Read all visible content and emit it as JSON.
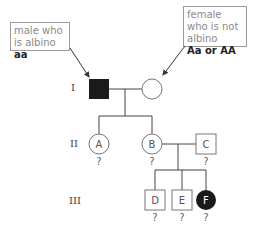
{
  "callouts": {
    "male": {
      "text": "male who is albino",
      "genotype": "aa"
    },
    "female": {
      "text": "female who is not albino",
      "genotype": "Aa or AA"
    }
  },
  "generations": [
    "I",
    "II",
    "III"
  ],
  "individuals": {
    "A": {
      "label": "A",
      "sex": "female",
      "affected": false,
      "genotype": "?"
    },
    "B": {
      "label": "B",
      "sex": "female",
      "affected": false,
      "genotype": "?"
    },
    "C": {
      "label": "C",
      "sex": "male",
      "affected": false,
      "genotype": "?"
    },
    "D": {
      "label": "D",
      "sex": "male",
      "affected": false,
      "genotype": "?"
    },
    "E": {
      "label": "E",
      "sex": "male",
      "affected": false,
      "genotype": "?"
    },
    "F": {
      "label": "F",
      "sex": "female",
      "affected": true,
      "genotype": "?"
    }
  },
  "colors": {
    "affected": "#1a1a1a",
    "line": "#444444",
    "border": "#9a9a9a"
  }
}
